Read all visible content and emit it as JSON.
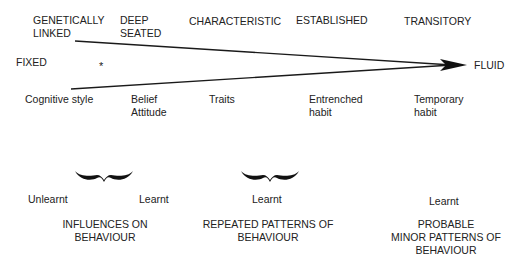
{
  "top_labels": [
    {
      "line1": "GENETICALLY",
      "line2": "LINKED"
    },
    {
      "line1": "DEEP",
      "line2": "SEATED"
    },
    {
      "line1": "CHARACTERISTIC",
      "line2": ""
    },
    {
      "line1": "ESTABLISHED",
      "line2": ""
    },
    {
      "line1": "TRANSITORY",
      "line2": ""
    }
  ],
  "axis": {
    "left_label": "FIXED",
    "right_label": "FLUID",
    "marker": "*"
  },
  "bottom_labels": [
    {
      "line1": "Cognitive style",
      "line2": ""
    },
    {
      "line1": "Belief",
      "line2": "Attitude"
    },
    {
      "line1": "Traits",
      "line2": ""
    },
    {
      "line1": "Entrenched",
      "line2": "habit"
    },
    {
      "line1": "Temporary",
      "line2": "habit"
    }
  ],
  "groups": [
    {
      "left_note": "Unlearnt",
      "right_note": "Learnt",
      "caption_line1": "INFLUENCES ON",
      "caption_line2": "BEHAVIOUR"
    },
    {
      "note": "Learnt",
      "caption_line1": "REPEATED PATTERNS OF",
      "caption_line2": "BEHAVIOUR"
    },
    {
      "note": "Learnt",
      "caption_line1": "PROBABLE",
      "caption_line2": "MINOR PATTERNS OF",
      "caption_line3": "BEHAVIOUR"
    }
  ]
}
